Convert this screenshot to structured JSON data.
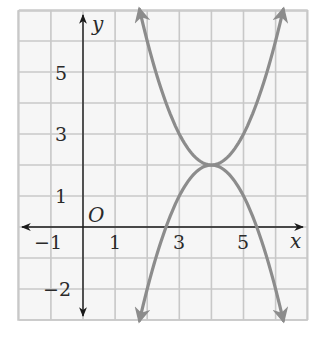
{
  "chart_data": {
    "type": "line",
    "title": "",
    "xlabel": "x",
    "ylabel": "y",
    "origin_label": "O",
    "xlim": [
      -2,
      7
    ],
    "ylim": [
      -3,
      7
    ],
    "grid": true,
    "x_tick_labels": [
      "-1",
      "1",
      "3",
      "5"
    ],
    "x_tick_values": [
      -1,
      1,
      3,
      5
    ],
    "y_tick_labels": [
      "5",
      "3",
      "1",
      "-2"
    ],
    "y_tick_values": [
      5,
      3,
      1,
      -2
    ],
    "series": [
      {
        "name": "upward parabola",
        "equation": "y = (x - 4)^2 + 2",
        "vertex": [
          4,
          2
        ],
        "opens": "up",
        "x": [
          1.76,
          2,
          2.5,
          3,
          3.5,
          4,
          4.5,
          5,
          5.5,
          6,
          6.24
        ],
        "y": [
          7.0,
          6,
          4.25,
          3,
          2.25,
          2,
          2.25,
          3,
          4.25,
          6,
          7.0
        ],
        "arrows": "both ends"
      },
      {
        "name": "downward parabola",
        "equation": "y = -(x - 4)^2 + 2",
        "vertex": [
          4,
          2
        ],
        "opens": "down",
        "x": [
          1.76,
          2,
          2.5,
          3,
          3.5,
          4,
          4.5,
          5,
          5.5,
          6,
          6.24
        ],
        "y": [
          -3.0,
          -2,
          -0.25,
          1,
          1.75,
          2,
          1.75,
          1,
          -0.25,
          -2,
          -3.0
        ],
        "arrows": "both ends"
      }
    ],
    "colors": {
      "curve": "#8c8c8c",
      "axis": "#1a1a1a",
      "grid": "#c8c8c8",
      "background": "#f6f6f6"
    }
  }
}
